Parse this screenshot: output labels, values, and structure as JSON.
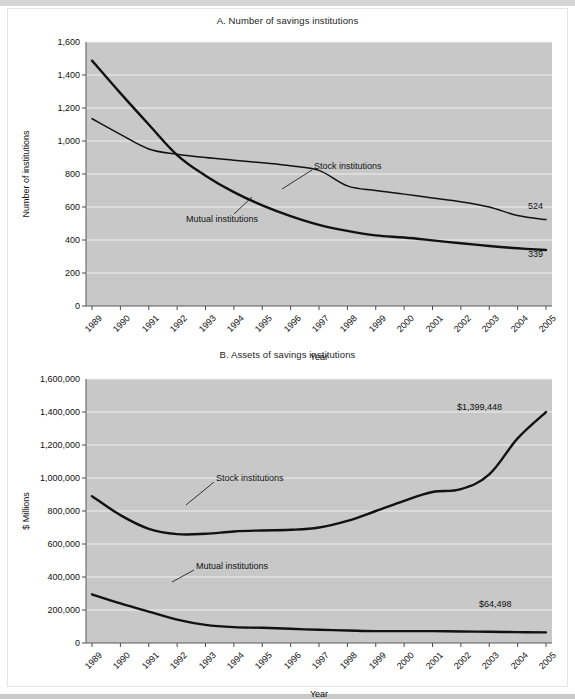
{
  "figure": {
    "background_color": "#ffffff",
    "plot_background_color": "#c8c8c8",
    "gridline_color": "#f0f0f0",
    "line_color": "#111111"
  },
  "chart_data": [
    {
      "id": "A",
      "type": "line",
      "title": "A. Number of savings institutions",
      "xlabel": "Year",
      "ylabel": "Number of institutions",
      "grid": true,
      "legend_position": "inline-annotation",
      "x": [
        1989,
        1990,
        1991,
        1992,
        1993,
        1994,
        1995,
        1996,
        1997,
        1998,
        1999,
        2000,
        2001,
        2002,
        2003,
        2004,
        2005
      ],
      "tick_labels": [
        "1989",
        "1990",
        "1991",
        "1992",
        "1993",
        "1994",
        "1995",
        "1996",
        "1997",
        "1998",
        "1999",
        "2000",
        "2001",
        "2002",
        "2003",
        "2004",
        "2005"
      ],
      "ylim": [
        0,
        1600
      ],
      "yticks": [
        0,
        200,
        400,
        600,
        800,
        1000,
        1200,
        1400,
        1600
      ],
      "ytick_labels": [
        "0",
        "200",
        "400",
        "600",
        "800",
        "1,000",
        "1,200",
        "1,400",
        "1,600"
      ],
      "series": [
        {
          "name": "Mutual institutions",
          "style": "thick",
          "values": [
            1487,
            1290,
            1100,
            915,
            790,
            690,
            610,
            545,
            492,
            455,
            428,
            415,
            398,
            380,
            364,
            350,
            339
          ],
          "end_label": "339",
          "annotation_label": "Mutual institutions"
        },
        {
          "name": "Stock institutions",
          "style": "thin",
          "values": [
            1135,
            1040,
            952,
            920,
            900,
            884,
            868,
            850,
            822,
            728,
            700,
            678,
            655,
            632,
            600,
            548,
            524
          ],
          "end_label": "524",
          "annotation_label": "Stock institutions"
        }
      ]
    },
    {
      "id": "B",
      "type": "line",
      "title": "B. Assets of savings institutions",
      "xlabel": "Year",
      "ylabel": "$ Millions",
      "grid": true,
      "legend_position": "inline-annotation",
      "x": [
        1989,
        1990,
        1991,
        1992,
        1993,
        1994,
        1995,
        1996,
        1997,
        1998,
        1999,
        2000,
        2001,
        2002,
        2003,
        2004,
        2005
      ],
      "tick_labels": [
        "1989",
        "1990",
        "1991",
        "1992",
        "1993",
        "1994",
        "1995",
        "1996",
        "1997",
        "1998",
        "1999",
        "2000",
        "2001",
        "2002",
        "2003",
        "2004",
        "2005"
      ],
      "ylim": [
        0,
        1600000
      ],
      "yticks": [
        0,
        200000,
        400000,
        600000,
        800000,
        1000000,
        1200000,
        1400000,
        1600000
      ],
      "ytick_labels": [
        "0",
        "200,000",
        "400,000",
        "600,000",
        "800,000",
        "1,000,000",
        "1,200,000",
        "1,400,000",
        "1,600,000"
      ],
      "series": [
        {
          "name": "Stock institutions",
          "style": "thick",
          "values": [
            890000,
            775000,
            692000,
            660000,
            662000,
            676000,
            682000,
            686000,
            700000,
            740000,
            800000,
            862000,
            915000,
            932000,
            1022000,
            1240000,
            1399448
          ],
          "end_label": "$1,399,448",
          "annotation_label": "Stock institutions"
        },
        {
          "name": "Mutual institutions",
          "style": "thick",
          "values": [
            295000,
            240000,
            190000,
            142000,
            110000,
            96000,
            92000,
            86000,
            80000,
            76000,
            72000,
            72000,
            72000,
            70000,
            68000,
            66000,
            64498
          ],
          "end_label": "$64,498",
          "annotation_label": "Mutual institutions"
        }
      ]
    }
  ]
}
